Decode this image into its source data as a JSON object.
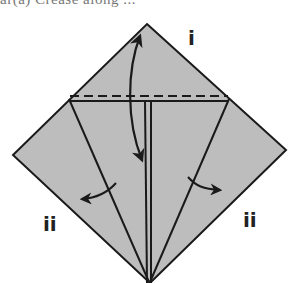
{
  "caption_fragment": "ar(a)  Crease along ...",
  "diagram": {
    "type": "origami fold step",
    "paper_color": "#bdbdbd",
    "line_color": "#1a1a1a",
    "outline": {
      "top": [
        147,
        24
      ],
      "right": [
        286,
        150
      ],
      "bottom": [
        150,
        283
      ],
      "left": [
        13,
        155
      ]
    },
    "fold_lines": {
      "valley_dashed": "horizontal dashed crease across upper triangle",
      "solid_edge": "horizontal folded edge below dashed crease",
      "center_slit": "vertical double line down the center",
      "left_diagonal": "edge from left fold corner to bottom point",
      "right_diagonal": "edge from right fold corner to bottom point"
    },
    "arrows": [
      {
        "name": "fold-down-arrow",
        "description": "double-headed curved arrow: fold top down and unfold"
      },
      {
        "name": "left-flap-arrow",
        "description": "curved arrow pointing left on left flap"
      },
      {
        "name": "right-flap-arrow",
        "description": "curved arrow pointing right on right flap"
      }
    ]
  },
  "labels": {
    "top": "i",
    "left": "ii",
    "right": "ii"
  }
}
